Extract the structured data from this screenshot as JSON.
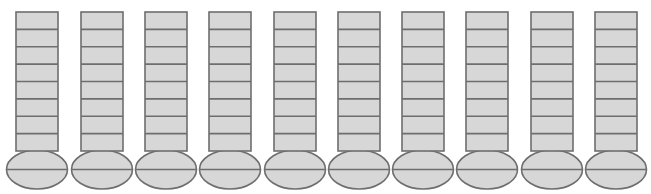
{
  "diagram": {
    "column_count": 10,
    "segments_per_column": 8,
    "colors": {
      "fill": "#d7d7d7",
      "stroke": "#6e6e6e",
      "background": "#ffffff"
    },
    "columns": [
      {
        "index": 1,
        "rect_x": 16
      },
      {
        "index": 2,
        "rect_x": 81
      },
      {
        "index": 3,
        "rect_x": 145
      },
      {
        "index": 4,
        "rect_x": 209
      },
      {
        "index": 5,
        "rect_x": 274
      },
      {
        "index": 6,
        "rect_x": 338
      },
      {
        "index": 7,
        "rect_x": 402
      },
      {
        "index": 8,
        "rect_x": 466
      },
      {
        "index": 9,
        "rect_x": 531
      },
      {
        "index": 10,
        "rect_x": 595
      }
    ],
    "geometry": {
      "rect_width": 42,
      "rect_top": 12,
      "rect_bottom": 151,
      "ellipse_rx": 30.5,
      "ellipse_ry": 19.5,
      "ellipse_cy": 169.5
    }
  }
}
